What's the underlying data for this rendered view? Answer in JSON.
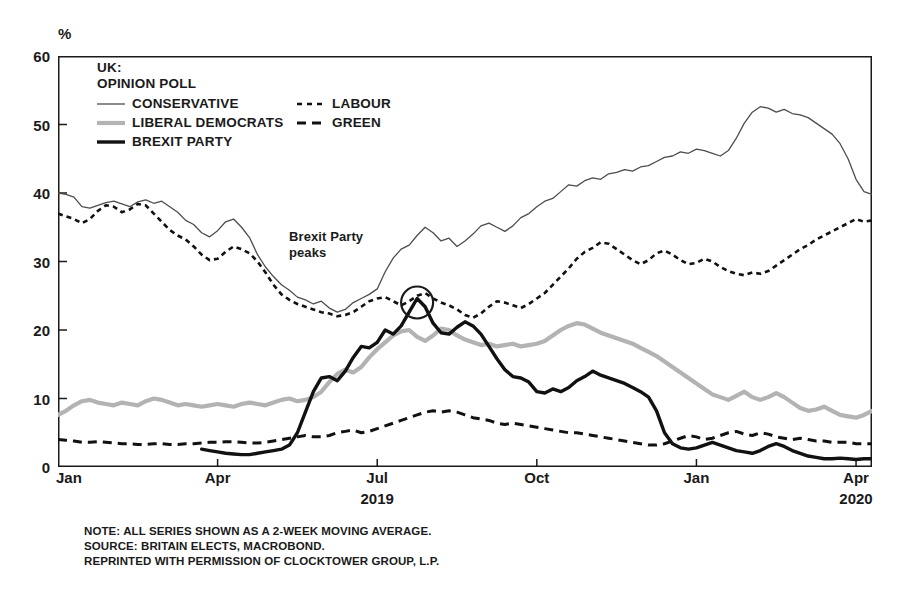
{
  "unit_label": "%",
  "legend": {
    "title_line1": "UK:",
    "title_line2": "OPINION POLL",
    "entries": [
      {
        "label": "CONSERVATIVE",
        "key": "conservative",
        "color": "#4d4d4d",
        "style": "solid-thin",
        "icon": "line-solid-thin-icon"
      },
      {
        "label": "LABOUR",
        "key": "labour",
        "color": "#111111",
        "style": "dotted",
        "icon": "line-dotted-icon"
      },
      {
        "label": "LIBERAL DEMOCRATS",
        "key": "libdem",
        "color": "#b3b3b3",
        "style": "solid-thick",
        "icon": "line-solid-thick-gray-icon"
      },
      {
        "label": "GREEN",
        "key": "green",
        "color": "#111111",
        "style": "dashed",
        "icon": "line-dashed-icon"
      },
      {
        "label": "BREXIT PARTY",
        "key": "brexit",
        "color": "#111111",
        "style": "solid-heavy",
        "icon": "line-solid-heavy-icon"
      }
    ]
  },
  "annotation": {
    "line1": "Brexit Party",
    "line2": "peaks",
    "marker": "circle-highlight"
  },
  "footer": {
    "line1": "NOTE: ALL SERIES SHOWN AS A 2-WEEK MOVING AVERAGE.",
    "line2": "SOURCE: BRITAIN ELECTS, MACROBOND.",
    "line3": "REPRINTED WITH PERMISSION OF CLOCKTOWER GROUP, L.P."
  },
  "chart_data": {
    "type": "line",
    "title": "UK: OPINION POLL",
    "xlabel": "",
    "ylabel": "%",
    "ylim": [
      0,
      60
    ],
    "ytick_labels": [
      "0",
      "10",
      "20",
      "30",
      "40",
      "50",
      "60"
    ],
    "yticks": [
      0,
      10,
      20,
      30,
      40,
      50,
      60
    ],
    "grid": false,
    "legend_position": "top-left-inside",
    "xlim": [
      "2019-01-01",
      "2020-06-01"
    ],
    "xtick_labels": [
      "Jan",
      "Apr",
      "Jul",
      "Oct",
      "Jan",
      "Apr"
    ],
    "xtick_positions": [
      0,
      0.25,
      0.5,
      0.75,
      1.0,
      1.25
    ],
    "xtick_years": [
      {
        "label": "2019",
        "position": 0.5
      },
      {
        "label": "2020",
        "position": 1.25
      }
    ],
    "annotations": [
      {
        "text": "Brexit Party peaks",
        "x": 0.4,
        "y": 24.5,
        "marker": "circle"
      }
    ],
    "series": [
      {
        "name": "CONSERVATIVE",
        "key": "conservative",
        "color": "#4d4d4d",
        "style": "solid-thin",
        "values": [
          40.0,
          39.8,
          39.4,
          38.0,
          37.8,
          38.2,
          38.6,
          38.8,
          38.4,
          38.0,
          38.7,
          39.0,
          38.5,
          38.8,
          38.0,
          37.2,
          36.0,
          35.4,
          34.2,
          33.6,
          34.5,
          35.8,
          36.2,
          35.0,
          33.5,
          31.0,
          29.2,
          27.8,
          26.6,
          25.8,
          24.8,
          24.4,
          23.8,
          24.2,
          23.2,
          22.6,
          23.0,
          24.0,
          24.6,
          25.2,
          26.0,
          28.5,
          30.5,
          31.8,
          32.4,
          33.8,
          35.0,
          34.2,
          33.0,
          33.4,
          32.2,
          33.0,
          34.0,
          35.2,
          35.6,
          35.0,
          34.4,
          35.2,
          36.4,
          37.0,
          38.0,
          38.8,
          39.2,
          40.2,
          41.2,
          41.0,
          41.8,
          42.2,
          42.0,
          42.8,
          43.0,
          43.4,
          43.2,
          43.8,
          44.0,
          44.6,
          45.2,
          45.4,
          46.0,
          45.8,
          46.4,
          46.2,
          45.8,
          45.4,
          46.2,
          48.0,
          50.2,
          51.8,
          52.6,
          52.4,
          51.8,
          52.2,
          51.6,
          51.4,
          51.0,
          50.2,
          49.4,
          48.6,
          47.2,
          45.0,
          42.0,
          40.2,
          39.8
        ]
      },
      {
        "name": "LABOUR",
        "key": "labour",
        "color": "#111111",
        "style": "dotted",
        "values": [
          37.0,
          36.6,
          36.2,
          35.6,
          36.2,
          37.4,
          38.2,
          38.0,
          37.2,
          37.6,
          38.4,
          38.2,
          37.0,
          35.8,
          34.6,
          33.8,
          33.2,
          32.2,
          31.0,
          30.2,
          30.4,
          31.4,
          32.2,
          31.8,
          31.2,
          30.0,
          28.4,
          26.6,
          25.2,
          24.4,
          23.8,
          23.4,
          23.0,
          22.6,
          22.4,
          22.0,
          22.2,
          22.6,
          23.4,
          24.2,
          24.6,
          24.8,
          24.2,
          23.6,
          24.2,
          25.0,
          25.4,
          24.6,
          24.0,
          23.6,
          23.0,
          22.2,
          21.8,
          22.4,
          23.4,
          24.2,
          24.0,
          23.6,
          23.2,
          23.8,
          24.6,
          25.4,
          26.6,
          27.8,
          29.0,
          30.4,
          31.4,
          32.0,
          32.8,
          32.6,
          31.8,
          31.0,
          30.2,
          29.6,
          30.2,
          31.2,
          31.6,
          31.0,
          30.2,
          29.6,
          29.8,
          30.4,
          30.0,
          29.2,
          28.6,
          28.2,
          28.0,
          28.4,
          28.2,
          28.6,
          29.4,
          30.2,
          31.0,
          31.8,
          32.4,
          33.2,
          33.8,
          34.4,
          35.0,
          35.6,
          36.2,
          35.8,
          36.0
        ]
      },
      {
        "name": "LIBERAL DEMOCRATS",
        "key": "libdem",
        "color": "#b3b3b3",
        "style": "solid-thick",
        "values": [
          7.6,
          8.2,
          9.0,
          9.6,
          9.8,
          9.4,
          9.2,
          9.0,
          9.4,
          9.2,
          9.0,
          9.6,
          10.0,
          9.8,
          9.4,
          9.0,
          9.2,
          9.0,
          8.8,
          9.0,
          9.2,
          9.0,
          8.8,
          9.2,
          9.4,
          9.2,
          9.0,
          9.4,
          9.8,
          10.0,
          9.6,
          9.8,
          10.2,
          11.0,
          12.4,
          13.6,
          14.2,
          13.8,
          14.6,
          16.0,
          17.2,
          18.2,
          19.2,
          19.8,
          20.0,
          19.0,
          18.4,
          19.2,
          20.2,
          20.0,
          19.2,
          18.6,
          18.2,
          17.8,
          18.0,
          17.6,
          17.8,
          18.0,
          17.6,
          17.8,
          18.0,
          18.4,
          19.2,
          20.0,
          20.6,
          21.0,
          20.8,
          20.2,
          19.6,
          19.2,
          18.8,
          18.4,
          18.0,
          17.4,
          16.8,
          16.2,
          15.4,
          14.6,
          13.8,
          13.0,
          12.2,
          11.4,
          10.6,
          10.2,
          9.8,
          10.4,
          11.0,
          10.2,
          9.8,
          10.2,
          10.8,
          10.2,
          9.4,
          8.6,
          8.2,
          8.4,
          8.8,
          8.2,
          7.6,
          7.4,
          7.2,
          7.6,
          8.2
        ]
      },
      {
        "name": "GREEN",
        "key": "green",
        "color": "#111111",
        "style": "dashed",
        "values": [
          4.0,
          3.9,
          3.8,
          3.6,
          3.6,
          3.7,
          3.6,
          3.5,
          3.4,
          3.4,
          3.3,
          3.3,
          3.4,
          3.4,
          3.3,
          3.3,
          3.4,
          3.4,
          3.5,
          3.6,
          3.6,
          3.7,
          3.7,
          3.6,
          3.5,
          3.5,
          3.6,
          3.8,
          4.0,
          4.2,
          4.4,
          4.6,
          4.4,
          4.4,
          4.6,
          5.0,
          5.2,
          5.4,
          5.0,
          5.2,
          5.6,
          6.0,
          6.4,
          6.8,
          7.2,
          7.6,
          8.0,
          8.2,
          8.0,
          8.2,
          8.0,
          7.6,
          7.2,
          7.0,
          6.8,
          6.4,
          6.2,
          6.4,
          6.2,
          6.0,
          5.8,
          5.6,
          5.4,
          5.2,
          5.0,
          5.0,
          4.8,
          4.6,
          4.4,
          4.2,
          4.0,
          3.8,
          3.6,
          3.4,
          3.2,
          3.2,
          3.4,
          3.8,
          4.2,
          4.6,
          4.4,
          4.0,
          4.2,
          4.6,
          5.0,
          5.2,
          4.8,
          4.6,
          5.0,
          4.8,
          4.4,
          4.2,
          4.0,
          4.2,
          4.0,
          3.8,
          3.8,
          3.6,
          3.6,
          3.6,
          3.4,
          3.4,
          3.4
        ]
      },
      {
        "name": "BREXIT PARTY",
        "key": "brexit",
        "color": "#111111",
        "style": "solid-heavy",
        "values": [
          null,
          null,
          null,
          null,
          null,
          null,
          null,
          null,
          null,
          null,
          null,
          null,
          null,
          null,
          null,
          null,
          null,
          null,
          2.6,
          2.4,
          2.2,
          2.0,
          1.9,
          1.8,
          1.8,
          2.0,
          2.2,
          2.4,
          2.6,
          3.2,
          5.0,
          8.0,
          11.0,
          13.0,
          13.2,
          12.6,
          14.0,
          16.0,
          17.6,
          17.4,
          18.2,
          20.0,
          19.4,
          20.6,
          22.6,
          24.6,
          23.4,
          21.0,
          19.6,
          19.4,
          20.4,
          21.2,
          20.6,
          19.4,
          17.6,
          15.8,
          14.2,
          13.2,
          13.0,
          12.4,
          11.0,
          10.8,
          11.4,
          11.0,
          11.6,
          12.6,
          13.2,
          14.0,
          13.4,
          13.0,
          12.6,
          12.2,
          11.6,
          11.0,
          10.2,
          8.2,
          5.0,
          3.4,
          2.8,
          2.6,
          2.8,
          3.2,
          3.6,
          3.2,
          2.8,
          2.4,
          2.2,
          2.0,
          2.4,
          3.0,
          3.4,
          3.0,
          2.4,
          2.0,
          1.6,
          1.4,
          1.2,
          1.2,
          1.3,
          1.2,
          1.1,
          1.2,
          1.2
        ]
      }
    ]
  }
}
